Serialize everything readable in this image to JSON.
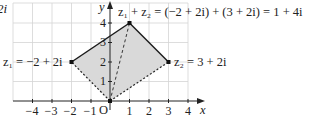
{
  "figure": {
    "partial_left_label": "2i",
    "axis_labels": {
      "x": "x",
      "y": "y",
      "origin": "O"
    },
    "x_ticks": [
      "−4",
      "−3",
      "−2",
      "−1",
      "1",
      "2",
      "3",
      "4"
    ],
    "y_ticks": [
      "1",
      "2",
      "3",
      "4"
    ],
    "points": {
      "z1": {
        "label": "z₁ = −2 + 2i",
        "re": -2,
        "im": 2
      },
      "z2": {
        "label": "z₂ = 3 + 2i",
        "re": 3,
        "im": 2
      },
      "sum": {
        "label": "z₁ + z₂ = (−2 + 2i) + (3 + 2i) = 1 + 4i",
        "re": 1,
        "im": 4
      }
    },
    "colors": {
      "fill": "#d9d9d9",
      "grid": "#d0d0d0",
      "line": "#1a1a1a"
    }
  }
}
